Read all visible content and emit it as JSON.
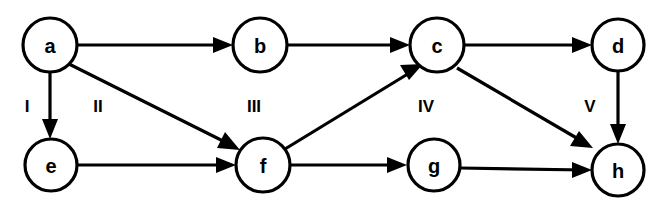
{
  "diagram": {
    "type": "directed-graph",
    "title": "",
    "width": 666,
    "height": 201,
    "background_color": "#ffffff",
    "stroke_color": "#000000",
    "node_fill_color": "#ffffff",
    "node_radius": 26,
    "nodes": [
      {
        "id": "a",
        "label": "a",
        "cx": 50,
        "cy": 45,
        "r": 27
      },
      {
        "id": "b",
        "label": "b",
        "cx": 260,
        "cy": 45,
        "r": 27
      },
      {
        "id": "c",
        "label": "c",
        "cx": 437,
        "cy": 45,
        "r": 27
      },
      {
        "id": "d",
        "label": "d",
        "cx": 618,
        "cy": 45,
        "r": 26
      },
      {
        "id": "e",
        "label": "e",
        "cx": 51,
        "cy": 165,
        "r": 26
      },
      {
        "id": "f",
        "label": "f",
        "cx": 263,
        "cy": 165,
        "r": 27
      },
      {
        "id": "g",
        "label": "g",
        "cx": 434,
        "cy": 165,
        "r": 26
      },
      {
        "id": "h",
        "label": "h",
        "cx": 618,
        "cy": 170,
        "r": 26
      }
    ],
    "edges": [
      {
        "id": "a-b",
        "from": "a",
        "to": "b",
        "directed": true
      },
      {
        "id": "b-c",
        "from": "b",
        "to": "c",
        "directed": true
      },
      {
        "id": "c-d",
        "from": "c",
        "to": "d",
        "directed": true
      },
      {
        "id": "a-e",
        "from": "a",
        "to": "e",
        "directed": true
      },
      {
        "id": "a-f",
        "from": "a",
        "to": "f",
        "directed": true
      },
      {
        "id": "e-f",
        "from": "e",
        "to": "f",
        "directed": true
      },
      {
        "id": "f-c",
        "from": "f",
        "to": "c",
        "directed": true
      },
      {
        "id": "f-g",
        "from": "f",
        "to": "g",
        "directed": true
      },
      {
        "id": "g-h",
        "from": "g",
        "to": "h",
        "directed": true
      },
      {
        "id": "c-h",
        "from": "c",
        "to": "h",
        "directed": true
      },
      {
        "id": "d-h",
        "from": "d",
        "to": "h",
        "directed": true
      }
    ],
    "column_labels": [
      {
        "id": "I",
        "text": "I",
        "x": 27,
        "y": 106
      },
      {
        "id": "II",
        "text": "II",
        "x": 98,
        "y": 106
      },
      {
        "id": "III",
        "text": "III",
        "x": 254,
        "y": 106
      },
      {
        "id": "IV",
        "text": "IV",
        "x": 426,
        "y": 106
      },
      {
        "id": "V",
        "text": "V",
        "x": 590,
        "y": 106
      }
    ]
  }
}
